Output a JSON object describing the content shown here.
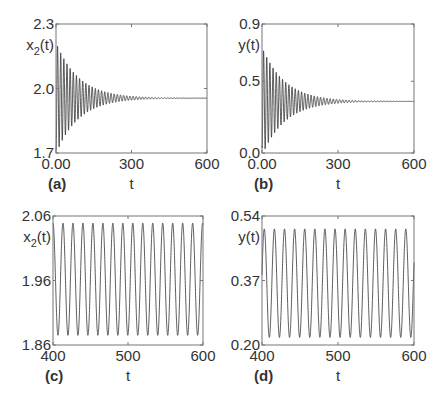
{
  "chart_data": [
    {
      "id": "a",
      "type": "line",
      "panel_label": "(a)",
      "title": "",
      "xlabel": "t",
      "ylabel": "x2(t)",
      "ylabel_main": "x",
      "ylabel_sub": "2",
      "ylabel_tail": "(t)",
      "xlim": [
        0,
        600
      ],
      "ylim": [
        1.7,
        2.3
      ],
      "xticks": [
        0,
        300,
        600
      ],
      "xtick_labels": [
        "0.00",
        "300",
        "600"
      ],
      "yticks": [
        1.7,
        2.0,
        2.3
      ],
      "ytick_labels": [
        "1.7",
        "2.0",
        "2.3"
      ],
      "grid": false,
      "signal": {
        "kind": "damped",
        "equilibrium": 1.955,
        "initial_amplitude": 0.26,
        "decay_time": 90,
        "period": 12.5,
        "start": 1.72
      },
      "box": {
        "left": 56,
        "top": 24,
        "right": 207,
        "bottom": 153
      }
    },
    {
      "id": "b",
      "type": "line",
      "panel_label": "(b)",
      "title": "",
      "xlabel": "t",
      "ylabel": "y(t)",
      "ylabel_main": "y(t)",
      "ylabel_sub": "",
      "ylabel_tail": "",
      "xlim": [
        0,
        600
      ],
      "ylim": [
        0.0,
        0.9
      ],
      "xticks": [
        0,
        300,
        600
      ],
      "xtick_labels": [
        "0.00",
        "300",
        "600"
      ],
      "yticks": [
        0.0,
        0.5,
        0.9
      ],
      "ytick_labels": [
        "0.0",
        "0.5",
        "0.9"
      ],
      "grid": false,
      "signal": {
        "kind": "damped",
        "equilibrium": 0.36,
        "initial_amplitude": 0.38,
        "decay_time": 90,
        "period": 12.5,
        "start": 0.05
      },
      "box": {
        "left": 262,
        "top": 24,
        "right": 414,
        "bottom": 153
      }
    },
    {
      "id": "c",
      "type": "line",
      "panel_label": "(c)",
      "title": "",
      "xlabel": "t",
      "ylabel": "x2(t)",
      "ylabel_main": "x",
      "ylabel_sub": "2",
      "ylabel_tail": "(t)",
      "xlim": [
        400,
        600
      ],
      "ylim": [
        1.86,
        2.06
      ],
      "xticks": [
        400,
        500,
        600
      ],
      "xtick_labels": [
        "400",
        "500",
        "600"
      ],
      "yticks": [
        1.86,
        1.96,
        2.06
      ],
      "ytick_labels": [
        "1.86",
        "1.96",
        "2.06"
      ],
      "grid": false,
      "signal": {
        "kind": "sustained",
        "center": 1.962,
        "amplitude": 0.087,
        "period": 13.3,
        "phase_start": 400
      },
      "box": {
        "left": 53,
        "top": 216,
        "right": 203,
        "bottom": 345
      }
    },
    {
      "id": "d",
      "type": "line",
      "panel_label": "(d)",
      "title": "",
      "xlabel": "t",
      "ylabel": "y(t)",
      "ylabel_main": "y(t)",
      "ylabel_sub": "",
      "ylabel_tail": "",
      "xlim": [
        400,
        600
      ],
      "ylim": [
        0.2,
        0.54
      ],
      "xticks": [
        400,
        500,
        600
      ],
      "xtick_labels": [
        "400",
        "500",
        "600"
      ],
      "yticks": [
        0.2,
        0.37,
        0.54
      ],
      "ytick_labels": [
        "0.20",
        "0.37",
        "0.54"
      ],
      "grid": false,
      "signal": {
        "kind": "sustained",
        "center": 0.363,
        "amplitude": 0.143,
        "period": 13.3,
        "phase_start": 403
      },
      "box": {
        "left": 262,
        "top": 216,
        "right": 414,
        "bottom": 345
      }
    }
  ],
  "colors": {
    "line": "#333333",
    "frame": "#777777",
    "text": "#333333",
    "background": "#ffffff"
  }
}
